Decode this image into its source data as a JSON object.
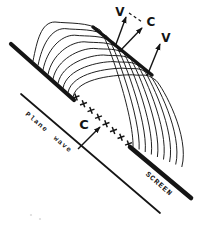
{
  "figure": {
    "background": "#ffffff",
    "ink": "#151515",
    "labels": {
      "v_top": "V",
      "c_top": "C",
      "v_right": "V",
      "c_mid": "C",
      "plane_wave": "Plane wave",
      "screen": "SCREEN"
    },
    "lines": {
      "barrier": {
        "x1": 11,
        "y1": 44,
        "x2": 74,
        "y2": 100,
        "w": 4.2
      },
      "envelope": {
        "x1": 93,
        "y1": 27,
        "x2": 152,
        "y2": 75,
        "w": 3.4
      },
      "screen": {
        "x1": 130,
        "y1": 147,
        "x2": 191,
        "y2": 198,
        "w": 4.6
      },
      "planewave": {
        "x1": 21,
        "y1": 94,
        "x2": 160,
        "y2": 213,
        "w": 1.7
      }
    },
    "wavelets": [
      "M33,61 C37,41 41,22 55,22 C68,23.5 89,22 100,30 C107,37 134,116 133,147",
      "M38,65.5 C42,45.5 50.7,28.6 64.7,28.6 C77.7,30.1 96,28.3 107,36.3 C114,43.3 141,118.5 139.1,149.5",
      "M43,70 C47,50 60.4,35.2 74.4,35.2 C87.4,36.7 103,34.6 114,42.6 C121,49.6 148,121 145.2,152",
      "M48,74.5 C52,54.5 70.1,41.8 84.1,41.8 C97.1,43.3 110,40.9 121,48.9 C128,55.9 155,123.5 151.3,154.5",
      "M53,79 C57,59 79.8,48.4 93.8,48.4 C106.8,49.9 117,47.2 128,55.2 C135,62.2 162,126 157.4,157",
      "M58,83.5 C62,63.5 89.5,55 103.5,55 C116.5,56.5 124,53.5 135,61.5 C142,68.5 169,128.5 163.5,159.5",
      "M63,88 C67,68 99.2,61.6 113.2,61.6 C126.2,63.1 131,59.8 142,67.8 C149,74.8 176,131 169.6,162",
      "M68,92.5 C72,72.5 108.9,68.2 122.9,68.2 C135.9,69.7 138,66.1 149,74.1 C156,81.1 183,133.5 175.7,164.5",
      "M73,97 C77,77 118.6,74.8 132.6,74.8 C145.6,76.3 145,72.4 156,80.4 C163,87.4 190,136 181.8,167"
    ],
    "source_marks": [
      [
        76,
        97
      ],
      [
        83.5,
        103.7
      ],
      [
        91,
        110.4
      ],
      [
        98.5,
        117.1
      ],
      [
        106,
        123.8
      ],
      [
        113.5,
        130.5
      ],
      [
        121,
        137.2
      ],
      [
        128.5,
        143.9
      ]
    ],
    "arrows": [
      {
        "name": "arrow-to-v-top",
        "x1": 115,
        "y1": 47,
        "x2": 126,
        "y2": 17
      },
      {
        "name": "arrow-to-c-top",
        "x1": 119,
        "y1": 52,
        "x2": 142,
        "y2": 28
      },
      {
        "name": "arrow-to-v-right",
        "x1": 147,
        "y1": 76,
        "x2": 160,
        "y2": 44
      },
      {
        "name": "arrow-to-c-mid",
        "x1": 78,
        "y1": 149,
        "x2": 100,
        "y2": 127
      }
    ],
    "dashed_leader": {
      "x1": 129,
      "y1": 13,
      "x2": 142,
      "y2": 22
    },
    "noise_dots": [
      [
        31,
        215
      ],
      [
        40,
        219
      ]
    ]
  }
}
